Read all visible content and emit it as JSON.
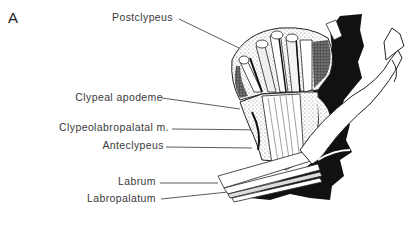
{
  "figure": {
    "panel_letter": "A",
    "labels": [
      {
        "id": "postclypeus",
        "text": "Postclypeus"
      },
      {
        "id": "clypeal-apodeme",
        "text": "Clypeal apodeme"
      },
      {
        "id": "clypeolabropalatal-m",
        "text": "Clypeolabropalatal m."
      },
      {
        "id": "anteclypeus",
        "text": "Anteclypeus"
      },
      {
        "id": "labrum",
        "text": "Labrum"
      },
      {
        "id": "labropalatum",
        "text": "Labropalatum"
      }
    ]
  }
}
